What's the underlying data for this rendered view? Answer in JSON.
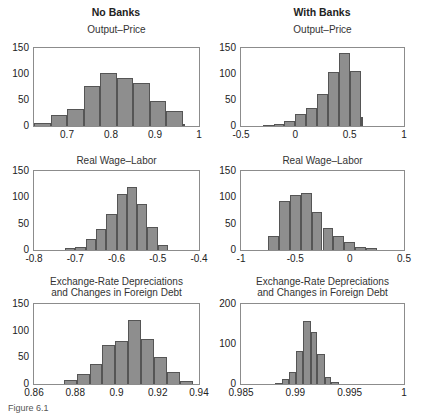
{
  "columns": [
    "No Banks",
    "With Banks"
  ],
  "caption": "Figure 6.1",
  "chart_data": [
    {
      "type": "bar",
      "panel": "No Banks",
      "title": "Output–Price",
      "xlim": [
        0.625,
        1.0
      ],
      "ylim": [
        0,
        150
      ],
      "xticks": [
        "0.7",
        "0.8",
        "0.9",
        "1"
      ],
      "xtick_values": [
        0.7,
        0.8,
        0.9,
        1.0
      ],
      "yticks": [
        "0",
        "50",
        "100",
        "150"
      ],
      "bin_edges": [
        0.625,
        0.6625,
        0.7,
        0.7375,
        0.775,
        0.8125,
        0.85,
        0.8875,
        0.925,
        0.9625
      ],
      "values": [
        6,
        22,
        33,
        76,
        101,
        93,
        83,
        49,
        28,
        4
      ]
    },
    {
      "type": "bar",
      "panel": "With Banks",
      "title": "Output–Price",
      "xlim": [
        -0.5,
        1.0
      ],
      "ylim": [
        0,
        150
      ],
      "xticks": [
        "-0.5",
        "0",
        "0.5",
        "1"
      ],
      "xtick_values": [
        -0.5,
        0,
        0.5,
        1.0
      ],
      "yticks": [
        "0",
        "50",
        "100",
        "150"
      ],
      "bin_edges": [
        -0.3,
        -0.2,
        -0.1,
        0.0,
        0.1,
        0.2,
        0.3,
        0.4,
        0.5,
        0.6
      ],
      "values": [
        1,
        4,
        10,
        23,
        34,
        62,
        103,
        140,
        105,
        18
      ]
    },
    {
      "type": "bar",
      "panel": "No Banks",
      "title": "Real Wage–Labor",
      "xlim": [
        -0.8,
        -0.4
      ],
      "ylim": [
        0,
        150
      ],
      "xticks": [
        "-0.8",
        "-0.7",
        "-0.6",
        "-0.5",
        "-0.4"
      ],
      "xtick_values": [
        -0.8,
        -0.7,
        -0.6,
        -0.5,
        -0.4
      ],
      "yticks": [
        "0",
        "50",
        "100",
        "150"
      ],
      "bin_edges": [
        -0.725,
        -0.7,
        -0.675,
        -0.65,
        -0.625,
        -0.6,
        -0.575,
        -0.55,
        -0.525,
        -0.5,
        -0.475
      ],
      "values": [
        4,
        6,
        21,
        39,
        69,
        106,
        119,
        87,
        43,
        10
      ]
    },
    {
      "type": "bar",
      "panel": "With Banks",
      "title": "Real Wage–Labor",
      "xlim": [
        -1.0,
        0.5
      ],
      "ylim": [
        0,
        150
      ],
      "xticks": [
        "-1",
        "-0.5",
        "0",
        "0.5"
      ],
      "xtick_values": [
        -1.0,
        -0.5,
        0,
        0.5
      ],
      "yticks": [
        "0",
        "50",
        "100",
        "150"
      ],
      "bin_edges": [
        -0.75,
        -0.65,
        -0.55,
        -0.45,
        -0.35,
        -0.25,
        -0.15,
        -0.05,
        0.05,
        0.15,
        0.25
      ],
      "values": [
        27,
        93,
        104,
        109,
        73,
        42,
        27,
        16,
        6,
        4
      ]
    },
    {
      "type": "bar",
      "panel": "No Banks",
      "title": "Exchange-Rate Depreciations and Changes in Foreign Debt",
      "xlim": [
        0.86,
        0.94
      ],
      "ylim": [
        0,
        150
      ],
      "xticks": [
        "0.86",
        "0.88",
        "0.9",
        "0.92",
        "0.94"
      ],
      "xtick_values": [
        0.86,
        0.88,
        0.9,
        0.92,
        0.94
      ],
      "yticks": [
        "0",
        "50",
        "100",
        "150"
      ],
      "bin_edges": [
        0.8745,
        0.8808,
        0.887,
        0.8932,
        0.8995,
        0.9057,
        0.912,
        0.9182,
        0.9245,
        0.9307,
        0.937
      ],
      "values": [
        7,
        18,
        38,
        74,
        81,
        120,
        85,
        50,
        23,
        6
      ]
    },
    {
      "type": "bar",
      "panel": "With Banks",
      "title": "Exchange-Rate Depreciations and Changes in Foreign Debt",
      "xlim": [
        0.985,
        1.0
      ],
      "ylim": [
        0,
        200
      ],
      "xticks": [
        "0.985",
        "0.99",
        "0.995",
        "1"
      ],
      "xtick_values": [
        0.985,
        0.99,
        0.995,
        1.0
      ],
      "yticks": [
        "0",
        "100",
        "200"
      ],
      "bin_edges": [
        0.9881,
        0.9888,
        0.9894,
        0.9901,
        0.9907,
        0.9914,
        0.992,
        0.9927,
        0.9933,
        0.994
      ],
      "values": [
        1,
        12,
        30,
        82,
        158,
        131,
        74,
        17,
        4
      ]
    }
  ]
}
